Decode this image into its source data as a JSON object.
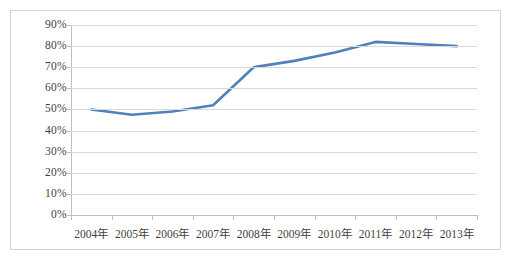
{
  "chart_data": {
    "type": "line",
    "title": "",
    "subtitle": "",
    "xlabel": "",
    "ylabel": "",
    "categories": [
      "2004年",
      "2005年",
      "2006年",
      "2007年",
      "2008年",
      "2009年",
      "2010年",
      "2011年",
      "2012年",
      "2013年"
    ],
    "series": [
      {
        "name": "",
        "values": [
          50,
          47.5,
          49,
          52,
          70,
          73,
          77,
          82,
          81,
          80
        ],
        "color": "#4f81bd"
      }
    ],
    "ylim": [
      0,
      90
    ],
    "ytick_step": 10,
    "ytick_labels": [
      "0%",
      "10%",
      "20%",
      "30%",
      "40%",
      "50%",
      "60%",
      "70%",
      "80%",
      "90%"
    ],
    "ytick_values": [
      0,
      10,
      20,
      30,
      40,
      50,
      60,
      70,
      80,
      90
    ],
    "grid": true,
    "grid_axis": "y",
    "legend": false,
    "legend_position": "none",
    "markers": false,
    "value_suffix": "%",
    "annotations": []
  },
  "style": {
    "line_color": "#4f81bd",
    "grid_color": "#d9d9d9",
    "axis_color": "#bfbfbf",
    "frame_color": "#d4d4d4",
    "text_color": "#3f3f3f",
    "plot_background": "#ffffff"
  }
}
